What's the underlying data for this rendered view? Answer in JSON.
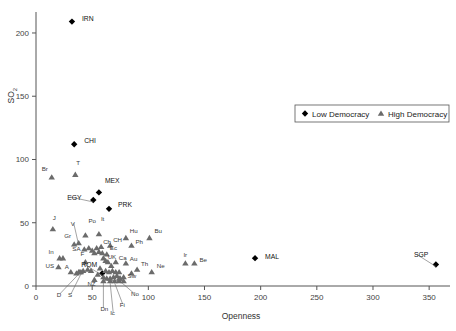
{
  "chart_data": {
    "type": "scatter",
    "title": "",
    "xlabel": "Openness",
    "ylabel": "SO2",
    "xlim": [
      0,
      365
    ],
    "ylim": [
      0,
      215
    ],
    "xticks": [
      0,
      50,
      100,
      150,
      200,
      250,
      300,
      350
    ],
    "yticks": [
      0,
      50,
      100,
      150,
      200
    ],
    "grid": false,
    "legend_position": "upper-right",
    "series": [
      {
        "name": "Low Democracy",
        "marker": "diamond",
        "color": "#000000",
        "points": [
          {
            "label": "IRN",
            "x": 32,
            "y": 209,
            "lx": 10,
            "ly": -1
          },
          {
            "label": "CHI",
            "x": 34,
            "y": 112,
            "lx": 10,
            "ly": -1
          },
          {
            "label": "MEX",
            "x": 56,
            "y": 74,
            "lx": 6,
            "ly": -9
          },
          {
            "label": "EGY",
            "x": 51,
            "y": 68,
            "lx": -26,
            "ly": 0
          },
          {
            "label": "PRK",
            "x": 65,
            "y": 61,
            "lx": 9,
            "ly": -2
          },
          {
            "label": "ROM",
            "x": 59,
            "y": 10,
            "lx": -21,
            "ly": -6
          },
          {
            "label": "MAL",
            "x": 195,
            "y": 22,
            "lx": 10,
            "ly": 1
          },
          {
            "label": "SGP",
            "x": 356,
            "y": 17,
            "lx": -22,
            "ly": -7
          }
        ]
      },
      {
        "name": "High Democracy",
        "marker": "triangle",
        "color": "#6b6b6b",
        "points": [
          {
            "label": "Br",
            "x": 14,
            "y": 86,
            "lx": -10,
            "ly": -6
          },
          {
            "label": "T",
            "x": 35,
            "y": 88,
            "lx": 1,
            "ly": -10
          },
          {
            "label": "J",
            "x": 15,
            "y": 45,
            "lx": 0,
            "ly": -9
          },
          {
            "label": "V",
            "x": 38,
            "y": 34,
            "lx": -8,
            "ly": -17
          },
          {
            "label": "Po",
            "x": 44,
            "y": 40,
            "lx": 3,
            "ly": -12
          },
          {
            "label": "Gr",
            "x": 34,
            "y": 33,
            "lx": -10,
            "ly": -6
          },
          {
            "label": "SA",
            "x": 43,
            "y": 29,
            "lx": -12,
            "ly": 2
          },
          {
            "label": "It",
            "x": 56,
            "y": 41,
            "lx": 2,
            "ly": -13
          },
          {
            "label": "Ch",
            "x": 58,
            "y": 31,
            "lx": 2,
            "ly": -3
          },
          {
            "label": "CH",
            "x": 66,
            "y": 32,
            "lx": 3,
            "ly": -4
          },
          {
            "label": "Hu",
            "x": 80,
            "y": 38,
            "lx": 4,
            "ly": -5
          },
          {
            "label": "Ph",
            "x": 85,
            "y": 32,
            "lx": 4,
            "ly": -2
          },
          {
            "label": "Bu",
            "x": 101,
            "y": 38,
            "lx": 5,
            "ly": -5
          },
          {
            "label": "In",
            "x": 21,
            "y": 22,
            "lx": -11,
            "ly": -4
          },
          {
            "label": "Ec",
            "x": 63,
            "y": 25,
            "lx": 3,
            "ly": -4
          },
          {
            "label": "UK",
            "x": 62,
            "y": 20,
            "lx": 2,
            "ly": -2
          },
          {
            "label": "Ca",
            "x": 71,
            "y": 19,
            "lx": 3,
            "ly": -2
          },
          {
            "label": "Au",
            "x": 80,
            "y": 18,
            "lx": 4,
            "ly": -2
          },
          {
            "label": "Th",
            "x": 90,
            "y": 13,
            "lx": 4,
            "ly": -4
          },
          {
            "label": "Ne",
            "x": 103,
            "y": 11,
            "lx": 5,
            "ly": -4
          },
          {
            "label": "Ir",
            "x": 133,
            "y": 18,
            "lx": -2,
            "ly": -6
          },
          {
            "label": "Be",
            "x": 141,
            "y": 18,
            "lx": 5,
            "ly": -1
          },
          {
            "label": "US",
            "x": 20,
            "y": 15,
            "lx": -13,
            "ly": 1
          },
          {
            "label": "F",
            "x": 44,
            "y": 19,
            "lx": -5,
            "ly": -6
          },
          {
            "label": "A",
            "x": 31,
            "y": 11,
            "lx": -6,
            "ly": -3
          },
          {
            "label": "NZ",
            "x": 52,
            "y": 5,
            "lx": -7,
            "ly": 6
          },
          {
            "label": "D",
            "x": 38,
            "y": 11,
            "lx": -22,
            "ly": 25
          },
          {
            "label": "S",
            "x": 40,
            "y": 11,
            "lx": -13,
            "ly": 25
          },
          {
            "label": "Dn",
            "x": 60,
            "y": 4,
            "lx": -3,
            "ly": 30
          },
          {
            "label": "Ic",
            "x": 66,
            "y": 4,
            "lx": 0,
            "ly": 34
          },
          {
            "label": "Fi",
            "x": 70,
            "y": 4,
            "lx": 5,
            "ly": 26
          },
          {
            "label": "No",
            "x": 74,
            "y": 6,
            "lx": 12,
            "ly": 18
          },
          {
            "label": "Sw",
            "x": 78,
            "y": 7,
            "lx": 4,
            "ly": 1
          }
        ]
      },
      {
        "name": "Unlabeled High Democracy",
        "marker": "triangle",
        "color": "#6b6b6b",
        "points": [
          {
            "label": "",
            "x": 47,
            "y": 30
          },
          {
            "label": "",
            "x": 50,
            "y": 28
          },
          {
            "label": "",
            "x": 52,
            "y": 26
          },
          {
            "label": "",
            "x": 54,
            "y": 30
          },
          {
            "label": "",
            "x": 56,
            "y": 27
          },
          {
            "label": "",
            "x": 59,
            "y": 26
          },
          {
            "label": "",
            "x": 60,
            "y": 22
          },
          {
            "label": "",
            "x": 64,
            "y": 19
          },
          {
            "label": "",
            "x": 67,
            "y": 16
          },
          {
            "label": "",
            "x": 57,
            "y": 14
          },
          {
            "label": "",
            "x": 62,
            "y": 12
          },
          {
            "label": "",
            "x": 65,
            "y": 11
          },
          {
            "label": "",
            "x": 68,
            "y": 12
          },
          {
            "label": "",
            "x": 71,
            "y": 11
          },
          {
            "label": "",
            "x": 74,
            "y": 11
          },
          {
            "label": "",
            "x": 55,
            "y": 9
          },
          {
            "label": "",
            "x": 60,
            "y": 7
          },
          {
            "label": "",
            "x": 63,
            "y": 6
          },
          {
            "label": "",
            "x": 66,
            "y": 6
          },
          {
            "label": "",
            "x": 69,
            "y": 7
          },
          {
            "label": "",
            "x": 72,
            "y": 8
          },
          {
            "label": "",
            "x": 75,
            "y": 6
          },
          {
            "label": "",
            "x": 49,
            "y": 12
          },
          {
            "label": "",
            "x": 46,
            "y": 13
          },
          {
            "label": "",
            "x": 42,
            "y": 12
          },
          {
            "label": "",
            "x": 39,
            "y": 11
          },
          {
            "label": "",
            "x": 36,
            "y": 10
          },
          {
            "label": "",
            "x": 24,
            "y": 22
          },
          {
            "label": "",
            "x": 85,
            "y": 10
          },
          {
            "label": "",
            "x": 74,
            "y": 4
          },
          {
            "label": "",
            "x": 78,
            "y": 4
          }
        ]
      }
    ]
  },
  "legend": {
    "entries": [
      {
        "label": "Low Democracy",
        "marker": "diamond"
      },
      {
        "label": "High Democracy",
        "marker": "triangle"
      }
    ]
  },
  "axes": {
    "x_title": "Openness",
    "y_title": "SO",
    "y_title_sub": "2",
    "x_tick_labels": [
      "0",
      "50",
      "100",
      "150",
      "200",
      "250",
      "300",
      "350"
    ],
    "y_tick_labels": [
      "0",
      "50",
      "100",
      "150",
      "200"
    ]
  }
}
